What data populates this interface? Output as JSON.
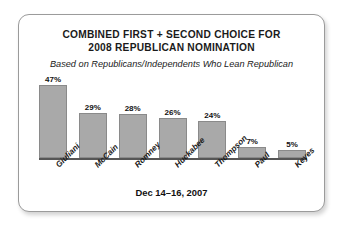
{
  "card": {
    "title_lines": [
      "COMBINED FIRST + SECOND CHOICE FOR",
      "2008 REPUBLICAN NOMINATION"
    ],
    "subtitle": "Based on Republicans/Independents Who Lean Republican",
    "footer": "Dec 14–16, 2007"
  },
  "chart_data": {
    "type": "bar",
    "title": "COMBINED FIRST + SECOND CHOICE FOR 2008 REPUBLICAN NOMINATION",
    "subtitle": "Based on Republicans/Independents Who Lean Republican",
    "note": "Dec 14–16, 2007",
    "categories": [
      "Giuliani",
      "McCain",
      "Romney",
      "Huckabee",
      "Thompson",
      "Paul",
      "Keyes"
    ],
    "values": [
      47,
      29,
      28,
      26,
      24,
      7,
      5
    ],
    "value_labels": [
      "47%",
      "29%",
      "28%",
      "26%",
      "24%",
      "7%",
      "5%"
    ],
    "xlabel": "",
    "ylabel": "",
    "ylim": [
      0,
      52
    ],
    "grid": false,
    "legend": false,
    "bar_color": "#a9a9a9",
    "bar_border_color": "#8a8a8a",
    "axis_color": "#565656",
    "text_color": "#1a1a1a"
  }
}
